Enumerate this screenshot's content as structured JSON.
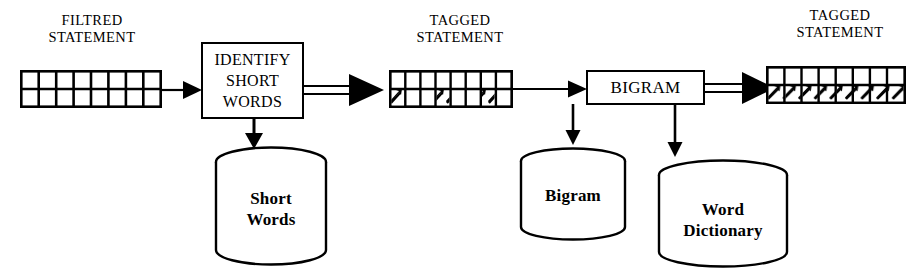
{
  "diagram": {
    "stroke_color": "#000000",
    "fill_color": "#ffffff",
    "background": "#ffffff"
  },
  "labels": {
    "filtred_statement": "FILTRED\nSTATEMENT",
    "tagged_statement_1": "TAGGED\nSTATEMENT",
    "tagged_statement_2": "TAGGED\nSTATEMENT"
  },
  "processes": [
    {
      "id": "identify-short-words",
      "label": "IDENTIFY\nSHORT\nWORDS"
    },
    {
      "id": "bigram",
      "label": "BIGRAM"
    }
  ],
  "datastores": [
    {
      "id": "short-words",
      "label": "Short\nWords"
    },
    {
      "id": "bigram-store",
      "label": "Bigram"
    },
    {
      "id": "word-dictionary",
      "label": "Word\nDictionary"
    }
  ],
  "statements": [
    {
      "id": "filtred-statement-grid",
      "columns": 8,
      "rows": 2,
      "tagged_cells": []
    },
    {
      "id": "tagged-statement-grid-1",
      "columns": 8,
      "rows": 2,
      "tagged_cells": [
        0,
        3,
        6
      ]
    },
    {
      "id": "tagged-statement-grid-2",
      "columns": 8,
      "rows": 2,
      "tagged_cells": [
        0,
        1,
        2,
        3,
        4,
        5,
        6,
        7
      ]
    }
  ],
  "connections": [
    {
      "id": "filtred-to-identify",
      "style": "single-line",
      "direction": "right"
    },
    {
      "id": "identify-to-tagged-1",
      "style": "double-line",
      "direction": "right"
    },
    {
      "id": "identify-to-short-words",
      "style": "single-line",
      "direction": "down"
    },
    {
      "id": "tagged-1-to-bigram",
      "style": "single-line",
      "direction": "right"
    },
    {
      "id": "bigram-to-tagged-2",
      "style": "double-line",
      "direction": "right"
    },
    {
      "id": "bigram-to-bigram-store",
      "style": "single-line",
      "direction": "down"
    },
    {
      "id": "bigram-to-word-dictionary",
      "style": "single-line",
      "direction": "down"
    }
  ]
}
